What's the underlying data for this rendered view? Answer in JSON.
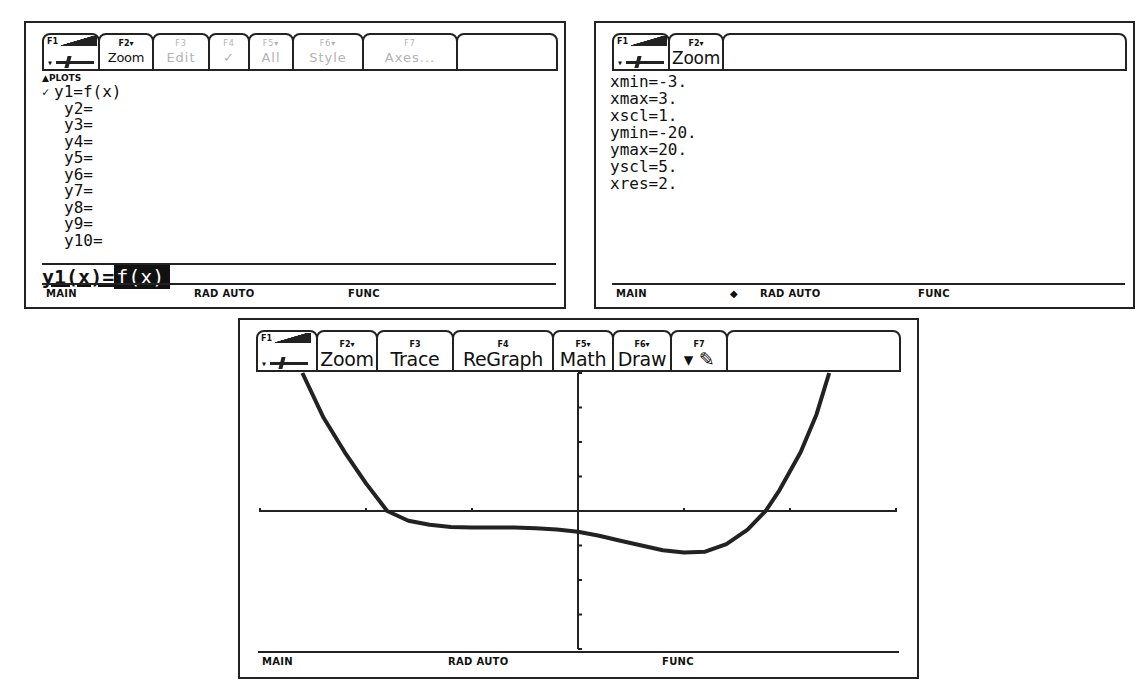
{
  "yeq_screen": {
    "toolbar": [
      {
        "fkey": "F1",
        "label": "",
        "icon": "hammer-saw-icon",
        "dim": false
      },
      {
        "fkey": "F2▾",
        "label": "Zoom",
        "dim": false
      },
      {
        "fkey": "F3",
        "label": "Edit",
        "dim": true
      },
      {
        "fkey": "F4",
        "label": "✓",
        "dim": true
      },
      {
        "fkey": "F5▾",
        "label": "All",
        "dim": true
      },
      {
        "fkey": "F6▾",
        "label": "Style",
        "dim": true
      },
      {
        "fkey": "F7",
        "label": "Axes...",
        "dim": true
      }
    ],
    "plots_header": "▲PLOTS",
    "functions": [
      {
        "check": "✓",
        "name": "y1=f(x)"
      },
      {
        "check": "",
        "name": "y2="
      },
      {
        "check": "",
        "name": "y3="
      },
      {
        "check": "",
        "name": "y4="
      },
      {
        "check": "",
        "name": "y5="
      },
      {
        "check": "",
        "name": "y6="
      },
      {
        "check": "",
        "name": "y7="
      },
      {
        "check": "",
        "name": "y8="
      },
      {
        "check": "",
        "name": "y9="
      },
      {
        "check": "",
        "name": "y10="
      }
    ],
    "entry_lhs": "y1(x)=",
    "entry_rhs": "f(x)",
    "status": {
      "folder": "MAIN",
      "mode": "RAD AUTO",
      "graph": "FUNC",
      "busy": ""
    }
  },
  "window_screen": {
    "toolbar": [
      {
        "fkey": "F1",
        "label": "",
        "icon": "hammer-saw-icon"
      },
      {
        "fkey": "F2▾",
        "label": "Zoom"
      }
    ],
    "vars": [
      "xmin=-3.",
      "xmax=3.",
      "xscl=1.",
      "ymin=-20.",
      "ymax=20.",
      "yscl=5.",
      "xres=2."
    ],
    "status": {
      "folder": "MAIN",
      "indicator": "◆",
      "mode": "RAD AUTO",
      "graph": "FUNC"
    }
  },
  "graph_screen": {
    "toolbar": [
      {
        "fkey": "F1",
        "label": "",
        "icon": "hammer-saw-icon"
      },
      {
        "fkey": "F2▾",
        "label": "Zoom"
      },
      {
        "fkey": "F3",
        "label": "Trace"
      },
      {
        "fkey": "F4",
        "label": "ReGraph"
      },
      {
        "fkey": "F5▾",
        "label": "Math"
      },
      {
        "fkey": "F6▾",
        "label": "Draw"
      },
      {
        "fkey": "F7",
        "label": "▾ ✎",
        "icon": "pencil-icon"
      }
    ],
    "status": {
      "folder": "MAIN",
      "mode": "RAD AUTO",
      "graph": "FUNC"
    }
  },
  "chart_data": {
    "type": "line",
    "title": "y1=f(x)",
    "xlabel": "",
    "ylabel": "",
    "xlim": [
      -3,
      3
    ],
    "ylim": [
      -20,
      20
    ],
    "xscl": 1,
    "yscl": 5,
    "grid": false,
    "series": [
      {
        "name": "y1",
        "x": [
          -2.6,
          -2.4,
          -2.2,
          -2.0,
          -1.8,
          -1.6,
          -1.4,
          -1.2,
          -1.0,
          -0.8,
          -0.6,
          -0.4,
          -0.2,
          0.0,
          0.2,
          0.4,
          0.6,
          0.8,
          1.0,
          1.2,
          1.4,
          1.6,
          1.77,
          1.9,
          2.1,
          2.25,
          2.37
        ],
        "y": [
          20,
          13.5,
          8.5,
          4,
          0,
          -1.4,
          -2.0,
          -2.3,
          -2.4,
          -2.4,
          -2.4,
          -2.5,
          -2.7,
          -3.0,
          -3.6,
          -4.3,
          -5.0,
          -5.7,
          -6.0,
          -5.9,
          -4.8,
          -2.7,
          0,
          3,
          8.5,
          14,
          20
        ]
      }
    ]
  }
}
